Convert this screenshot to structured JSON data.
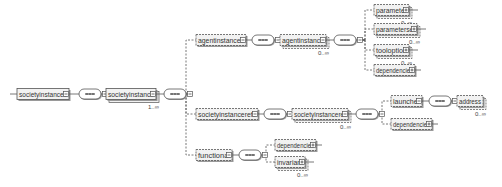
{
  "diagram": {
    "colors": {
      "box_fill": "#f2f2f2",
      "box_stroke": "#555555",
      "shadow": "#9a9a9a",
      "text": "#333333",
      "line": "#555555"
    },
    "nodes": [
      {
        "id": "societyinstances",
        "label": "societyinstances",
        "x": 17,
        "y": 94,
        "w": 52,
        "optional": false,
        "multi": false,
        "expand": "minus",
        "occ": ""
      },
      {
        "id": "seq1",
        "type": "sequence",
        "x": 79,
        "y": 94
      },
      {
        "id": "societyinstance",
        "label": "societyinstance",
        "x": 106,
        "y": 94,
        "w": 50,
        "optional": false,
        "multi": true,
        "expand": "minus",
        "occ": "1..∞"
      },
      {
        "id": "seq2",
        "type": "sequence",
        "x": 164,
        "y": 94
      },
      {
        "id": "agentinstances",
        "label": "agentinstances",
        "x": 196,
        "y": 40,
        "w": 50,
        "optional": true,
        "multi": false,
        "expand": "minus",
        "occ": ""
      },
      {
        "id": "seq3",
        "type": "sequence",
        "x": 252,
        "y": 40
      },
      {
        "id": "agentinstance",
        "label": "agentinstance",
        "x": 280,
        "y": 40,
        "w": 46,
        "optional": true,
        "multi": true,
        "expand": "minus",
        "occ": "0..∞"
      },
      {
        "id": "seq4",
        "type": "sequence",
        "x": 334,
        "y": 40
      },
      {
        "id": "parameter",
        "label": "parameter",
        "x": 374,
        "y": 10,
        "w": 35,
        "optional": true,
        "multi": true,
        "expand": "plus",
        "occ": "0..∞"
      },
      {
        "id": "parameterset",
        "label": "parameterset",
        "x": 374,
        "y": 29,
        "w": 43,
        "optional": true,
        "multi": true,
        "expand": "plus",
        "occ": "0..∞"
      },
      {
        "id": "tooloption",
        "label": "tooloption",
        "x": 374,
        "y": 50,
        "w": 35,
        "optional": true,
        "multi": true,
        "expand": "plus",
        "occ": "0..∞"
      },
      {
        "id": "dependencies_a",
        "label": "dependencies",
        "x": 374,
        "y": 70,
        "w": 41,
        "optional": true,
        "multi": false,
        "expand": "plus",
        "occ": ""
      },
      {
        "id": "societyinstancerefs",
        "label": "societyinstancerefs",
        "x": 196,
        "y": 114,
        "w": 62,
        "optional": true,
        "multi": false,
        "expand": "minus",
        "occ": ""
      },
      {
        "id": "seq5",
        "type": "sequence",
        "x": 264,
        "y": 114
      },
      {
        "id": "societyinstanceref",
        "label": "societyinstanceref",
        "x": 292,
        "y": 114,
        "w": 56,
        "optional": true,
        "multi": true,
        "expand": "minus",
        "occ": "0..∞"
      },
      {
        "id": "seq6",
        "type": "sequence",
        "x": 356,
        "y": 114
      },
      {
        "id": "launcher",
        "label": "launcher",
        "x": 391,
        "y": 101,
        "w": 31,
        "optional": true,
        "multi": false,
        "expand": "minus",
        "occ": ""
      },
      {
        "id": "seq7",
        "type": "sequence",
        "x": 429,
        "y": 101
      },
      {
        "id": "address",
        "label": "address",
        "x": 457,
        "y": 101,
        "w": 26,
        "optional": true,
        "multi": true,
        "expand": "none",
        "occ": "0..∞"
      },
      {
        "id": "dependencies_b",
        "label": "dependencies",
        "x": 391,
        "y": 124,
        "w": 41,
        "optional": true,
        "multi": false,
        "expand": "plus",
        "occ": ""
      },
      {
        "id": "functional",
        "label": "functional",
        "x": 196,
        "y": 155,
        "w": 36,
        "optional": true,
        "multi": false,
        "expand": "minus",
        "occ": ""
      },
      {
        "id": "seq8",
        "type": "sequence",
        "x": 239,
        "y": 155
      },
      {
        "id": "dependencies_c",
        "label": "dependencies",
        "x": 275,
        "y": 145,
        "w": 41,
        "optional": true,
        "multi": false,
        "expand": "plus",
        "occ": ""
      },
      {
        "id": "invariant",
        "label": "invariant",
        "x": 275,
        "y": 162,
        "w": 30,
        "optional": true,
        "multi": true,
        "expand": "plus",
        "occ": "0..∞"
      }
    ],
    "edges": [
      {
        "from": "societyinstances",
        "to": "seq1"
      },
      {
        "from": "seq1",
        "to": "societyinstance"
      },
      {
        "from": "societyinstance",
        "to": "seq2"
      },
      {
        "from": "seq2",
        "to": "agentinstances",
        "branch_x": 186
      },
      {
        "from": "seq2",
        "to": "societyinstancerefs",
        "branch_x": 186
      },
      {
        "from": "seq2",
        "to": "functional",
        "branch_x": 186
      },
      {
        "from": "agentinstances",
        "to": "seq3"
      },
      {
        "from": "seq3",
        "to": "agentinstance"
      },
      {
        "from": "agentinstance",
        "to": "seq4"
      },
      {
        "from": "seq4",
        "to": "parameter",
        "branch_x": 365
      },
      {
        "from": "seq4",
        "to": "parameterset",
        "branch_x": 365
      },
      {
        "from": "seq4",
        "to": "tooloption",
        "branch_x": 365
      },
      {
        "from": "seq4",
        "to": "dependencies_a",
        "branch_x": 365
      },
      {
        "from": "societyinstancerefs",
        "to": "seq5"
      },
      {
        "from": "seq5",
        "to": "societyinstanceref"
      },
      {
        "from": "societyinstanceref",
        "to": "seq6"
      },
      {
        "from": "seq6",
        "to": "launcher",
        "branch_x": 382
      },
      {
        "from": "seq6",
        "to": "dependencies_b",
        "branch_x": 382
      },
      {
        "from": "launcher",
        "to": "seq7"
      },
      {
        "from": "seq7",
        "to": "address"
      },
      {
        "from": "functional",
        "to": "seq8"
      },
      {
        "from": "seq8",
        "to": "dependencies_c",
        "branch_x": 266
      },
      {
        "from": "seq8",
        "to": "invariant",
        "branch_x": 266
      }
    ]
  }
}
